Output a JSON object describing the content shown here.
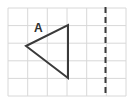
{
  "figure": {
    "width": 134,
    "height": 104,
    "background_color": "#ffffff"
  },
  "grid": {
    "name": "square-grid",
    "line_color": "#d8d8d8",
    "line_width": 1,
    "x_start": 8,
    "y_start": 8,
    "x_end": 126,
    "y_end": 96,
    "columns": 6,
    "rows": 5,
    "cell_width": 19.67,
    "cell_height": 17.6,
    "vertical_line_x": [
      8,
      27.7,
      47.3,
      67,
      86.7,
      106.3,
      126
    ],
    "horizontal_line_y": [
      8,
      25.6,
      43.2,
      60.8,
      78.4,
      96
    ]
  },
  "shape": {
    "name": "triangle-a",
    "label": "A",
    "label_x": 34,
    "label_y": 32,
    "stroke_color": "#3a3a3a",
    "stroke_width": 2,
    "fill": "none",
    "points": "26,46 68,25 68,78",
    "vertices": [
      {
        "name": "left-apex",
        "x": 26,
        "y": 46
      },
      {
        "name": "top-right",
        "x": 68,
        "y": 25
      },
      {
        "name": "bottom-right",
        "x": 68,
        "y": 78
      }
    ]
  },
  "mirror_line": {
    "name": "mirror-line",
    "orientation": "vertical",
    "x": 105.5,
    "y_start": 7,
    "y_end": 97,
    "stroke_color": "#3a3a3a",
    "stroke_width": 2,
    "dash_pattern": "6 4"
  }
}
